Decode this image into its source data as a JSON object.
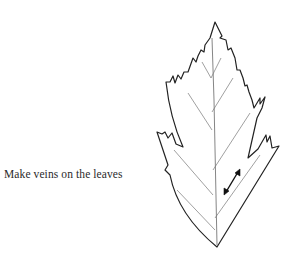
{
  "caption": {
    "text": "Make veins on the leaves"
  },
  "figure": {
    "colors": {
      "background": "#ffffff",
      "outline": "#222222",
      "veins": "#555555",
      "arrow": "#111111",
      "text": "#2a2a2a"
    },
    "annotations": [
      {
        "type": "double-headed-arrow",
        "meaning": "vein spacing indicator"
      }
    ]
  }
}
